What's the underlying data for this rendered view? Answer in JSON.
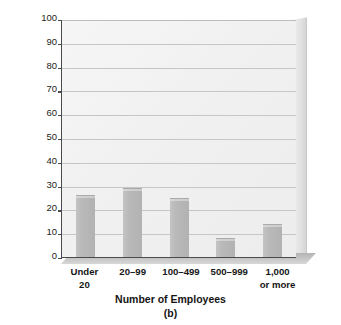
{
  "chart_data": {
    "type": "bar",
    "title": "",
    "caption": "(b)",
    "xlabel": "Number of Employees",
    "ylabel": "Percentage of All U.S. Workers",
    "categories": [
      "Under 20",
      "20–99",
      "100–499",
      "500–999",
      "1,000 or more"
    ],
    "category_lines": [
      [
        "Under",
        "20"
      ],
      [
        "20–99",
        ""
      ],
      [
        "100–499",
        ""
      ],
      [
        "500–999",
        ""
      ],
      [
        "1,000",
        "or more"
      ]
    ],
    "values": [
      26,
      29,
      25,
      8,
      14
    ],
    "ylim": [
      0,
      100
    ],
    "yticks": [
      0,
      10,
      20,
      30,
      40,
      50,
      60,
      70,
      80,
      90,
      100
    ],
    "ytick_labels": [
      "0",
      "10",
      "20",
      "30",
      "40",
      "50",
      "60",
      "70",
      "80",
      "90",
      "100"
    ],
    "grid": true,
    "legend": "none",
    "style": "3d-shaded",
    "colors": {
      "bar": "#b9b9b9",
      "plot_background": "#f1f1f1",
      "gridline": "#c6c6c6",
      "axis": "#4a4a4a",
      "floor": "#c9c9c9",
      "text": "#161616"
    }
  }
}
